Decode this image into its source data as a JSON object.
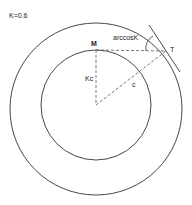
{
  "diagram": {
    "parameter_label": "K=0.6",
    "point_m": "M",
    "point_t": "T",
    "radius_inner_label": "Kc",
    "radius_outer_label": "c",
    "angle_label": "arccosK",
    "stroke_color": "#333333",
    "dash_color": "#555555"
  }
}
